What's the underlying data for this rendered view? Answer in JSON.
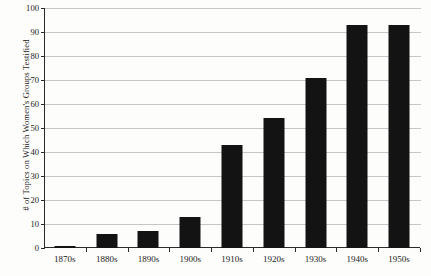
{
  "chart_data": {
    "type": "bar",
    "title": "",
    "xlabel": "",
    "ylabel": "# of Topics on Which Women's Groups Testified",
    "categories": [
      "1870s",
      "1880s",
      "1890s",
      "1900s",
      "1910s",
      "1920s",
      "1930s",
      "1940s",
      "1950s"
    ],
    "values": [
      1,
      6,
      7,
      13,
      43,
      54,
      71,
      93,
      93
    ],
    "ylim": [
      0,
      100
    ],
    "ytick_step": 10,
    "ytick_labels": [
      "0",
      "10",
      "20",
      "30",
      "40",
      "50",
      "60",
      "70",
      "80",
      "90",
      "100"
    ],
    "grid": true,
    "legend": null,
    "bar_color": "#131313",
    "gridline_color": "#c6c6c6",
    "axis_color": "#2a2a2a",
    "background_color": "#fdfdfc"
  }
}
